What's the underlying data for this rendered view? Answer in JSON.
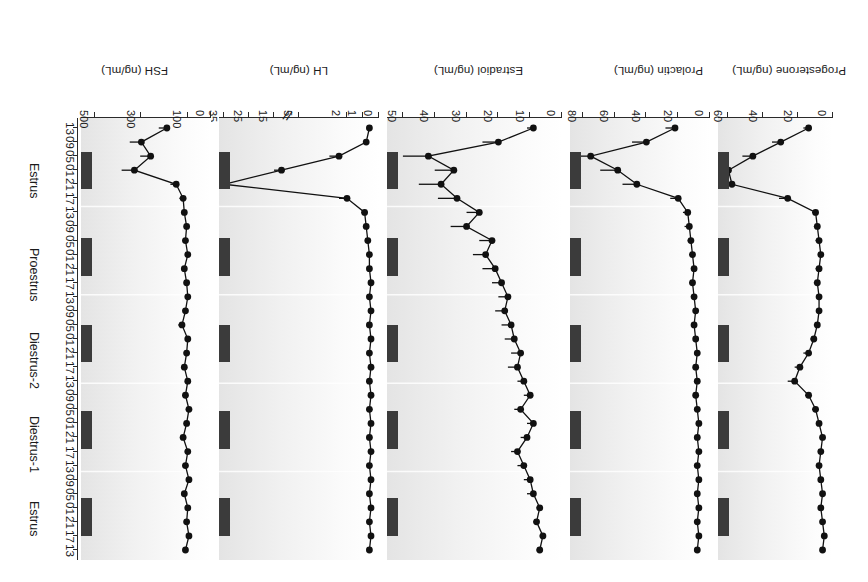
{
  "figure": {
    "rotation_degrees": 180,
    "background_color": "#ffffff",
    "marker_color": "#111111",
    "night_bar_color": "#3b3b3b"
  },
  "time_axis": {
    "hour_labels": [
      "13",
      "17",
      "21",
      "01",
      "05",
      "09",
      "13",
      "17",
      "21",
      "01",
      "05",
      "09",
      "13",
      "17",
      "21",
      "01",
      "05",
      "09",
      "13",
      "17",
      "21",
      "01",
      "05",
      "09",
      "13",
      "17",
      "21",
      "01",
      "05",
      "09",
      "13"
    ],
    "stage_labels": [
      "Estrus",
      "Diestrus-1",
      "Diestrus-2",
      "Proestrus",
      "Estrus"
    ],
    "night_periods": 5
  },
  "chart_data": [
    {
      "type": "line",
      "title": "Progesterone",
      "ylabel": "Progesterone (ng/mL)",
      "xlabel": "",
      "ylim": [
        0,
        66
      ],
      "yticks": [
        0,
        20,
        40,
        60
      ],
      "ytick_labels": [
        "0",
        "20",
        "40",
        "60"
      ],
      "axis_break": false,
      "grid": false,
      "x": [
        0,
        1,
        2,
        3,
        4,
        5,
        6,
        7,
        8,
        9,
        10,
        11,
        12,
        13,
        14,
        15,
        16,
        17,
        18,
        19,
        20,
        21,
        22,
        23,
        24,
        25,
        26,
        27,
        28,
        29,
        30
      ],
      "values": [
        6,
        5,
        6,
        7,
        6,
        7,
        8,
        7,
        6,
        8,
        10,
        14,
        22,
        19,
        14,
        11,
        9,
        8,
        8,
        9,
        8,
        7,
        8,
        9,
        10,
        26,
        58,
        60,
        46,
        30,
        14
      ],
      "errors": [
        1,
        1,
        1,
        1,
        1,
        1,
        1,
        1,
        1,
        1,
        2,
        2,
        4,
        3,
        3,
        2,
        2,
        1,
        1,
        2,
        2,
        1,
        2,
        2,
        2,
        5,
        8,
        7,
        6,
        5,
        3
      ]
    },
    {
      "type": "line",
      "title": "Prolactin",
      "ylabel": "Prolactin (ng/mL)",
      "xlabel": "",
      "ylim": [
        0,
        88
      ],
      "yticks": [
        0,
        20,
        40,
        60,
        80
      ],
      "ytick_labels": [
        "0",
        "20",
        "40",
        "60",
        "80"
      ],
      "axis_break": false,
      "grid": false,
      "x": [
        0,
        1,
        2,
        3,
        4,
        5,
        6,
        7,
        8,
        9,
        10,
        11,
        12,
        13,
        14,
        15,
        16,
        17,
        18,
        19,
        20,
        21,
        22,
        23,
        24,
        25,
        26,
        27,
        28,
        29,
        30
      ],
      "values": [
        8,
        7,
        8,
        7,
        8,
        7,
        8,
        7,
        8,
        7,
        8,
        9,
        8,
        9,
        8,
        9,
        10,
        9,
        10,
        11,
        10,
        11,
        12,
        13,
        14,
        20,
        46,
        58,
        75,
        40,
        22
      ],
      "errors": [
        1,
        1,
        1,
        1,
        1,
        1,
        1,
        1,
        1,
        1,
        1,
        1,
        1,
        1,
        1,
        1,
        2,
        1,
        2,
        2,
        2,
        2,
        2,
        3,
        3,
        5,
        9,
        11,
        13,
        9,
        6
      ]
    },
    {
      "type": "line",
      "title": "Estradiol",
      "ylabel": "Estradiol (ng/mL)",
      "xlabel": "",
      "ylim": [
        0,
        55
      ],
      "yticks": [
        0,
        10,
        20,
        30,
        40,
        50
      ],
      "ytick_labels": [
        "0",
        "10",
        "20",
        "30",
        "40",
        "50"
      ],
      "axis_break": false,
      "grid": false,
      "x": [
        0,
        1,
        2,
        3,
        4,
        5,
        6,
        7,
        8,
        9,
        10,
        11,
        12,
        13,
        14,
        15,
        16,
        17,
        18,
        19,
        20,
        21,
        22,
        23,
        24,
        25,
        26,
        27,
        28,
        29,
        30
      ],
      "values": [
        7,
        6,
        8,
        7,
        9,
        10,
        12,
        14,
        11,
        9,
        13,
        10,
        12,
        14,
        13,
        15,
        16,
        18,
        17,
        19,
        21,
        24,
        22,
        30,
        26,
        33,
        38,
        34,
        42,
        20,
        9
      ],
      "errors": [
        1,
        1,
        1,
        1,
        2,
        2,
        2,
        2,
        2,
        2,
        2,
        2,
        2,
        3,
        3,
        3,
        3,
        3,
        3,
        3,
        4,
        4,
        4,
        5,
        4,
        6,
        7,
        6,
        8,
        5,
        2
      ]
    },
    {
      "type": "line",
      "title": "LH",
      "ylabel": "LH (ng/mL)",
      "xlabel": "",
      "ylim": [
        0,
        37
      ],
      "yticks": [
        0,
        1,
        2,
        5,
        15,
        25,
        35
      ],
      "ytick_labels": [
        "0",
        "1",
        "2",
        "5",
        "15",
        "25",
        "35"
      ],
      "axis_break": true,
      "axis_break_between": [
        5,
        15
      ],
      "grid": false,
      "x": [
        0,
        1,
        2,
        3,
        4,
        5,
        6,
        7,
        8,
        9,
        10,
        11,
        12,
        13,
        14,
        15,
        16,
        17,
        18,
        19,
        20,
        21,
        22,
        23,
        24,
        25,
        26,
        27,
        28,
        29,
        30
      ],
      "values": [
        0.6,
        0.5,
        0.6,
        0.5,
        0.6,
        0.5,
        0.6,
        0.5,
        0.6,
        0.5,
        0.6,
        0.5,
        0.6,
        0.5,
        0.6,
        0.5,
        0.6,
        0.5,
        0.6,
        0.5,
        0.6,
        0.6,
        0.7,
        0.8,
        0.9,
        2.0,
        35.0,
        12.0,
        2.5,
        0.8,
        0.6
      ],
      "errors": [
        0.1,
        0.1,
        0.1,
        0.1,
        0.1,
        0.1,
        0.1,
        0.1,
        0.1,
        0.1,
        0.1,
        0.1,
        0.1,
        0.1,
        0.1,
        0.1,
        0.1,
        0.1,
        0.1,
        0.1,
        0.1,
        0.1,
        0.1,
        0.1,
        0.2,
        0.5,
        5.0,
        3.0,
        0.6,
        0.2,
        0.1
      ]
    },
    {
      "type": "line",
      "title": "FSH",
      "ylabel": "FSH (ng/mL)",
      "xlabel": "",
      "ylim": [
        0,
        560
      ],
      "yticks": [
        0,
        100,
        300,
        500
      ],
      "ytick_labels": [
        "0",
        "100",
        "300",
        "500"
      ],
      "axis_break": false,
      "grid": false,
      "x": [
        0,
        1,
        2,
        3,
        4,
        5,
        6,
        7,
        8,
        9,
        10,
        11,
        12,
        13,
        14,
        15,
        16,
        17,
        18,
        19,
        20,
        21,
        22,
        23,
        24,
        25,
        26,
        27,
        28,
        29,
        30
      ],
      "values": [
        110,
        95,
        105,
        100,
        115,
        95,
        110,
        100,
        120,
        105,
        95,
        110,
        100,
        115,
        105,
        100,
        125,
        110,
        100,
        105,
        115,
        100,
        110,
        105,
        115,
        120,
        150,
        330,
        260,
        300,
        190
      ],
      "errors": [
        12,
        10,
        12,
        10,
        14,
        10,
        12,
        10,
        14,
        12,
        10,
        12,
        10,
        14,
        12,
        10,
        16,
        12,
        10,
        12,
        14,
        10,
        12,
        10,
        14,
        16,
        25,
        55,
        45,
        50,
        35
      ]
    }
  ]
}
